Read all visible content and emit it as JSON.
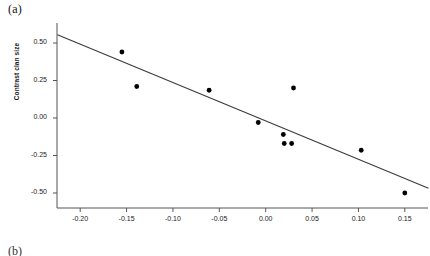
{
  "figure": {
    "panel_label": "(a)",
    "next_panel_label": "(b)"
  },
  "chart_data": {
    "type": "scatter",
    "title": "",
    "xlabel": "",
    "ylabel": "Contrast clan size",
    "xlim": [
      -0.225,
      0.175
    ],
    "ylim": [
      -0.6,
      0.62
    ],
    "grid": false,
    "legend": null,
    "xticks": [
      -0.2,
      -0.15,
      -0.1,
      -0.05,
      0.0,
      0.05,
      0.1,
      0.15
    ],
    "xticklabels": [
      "-0.20",
      "-0.15",
      "-0.10",
      "-0.05",
      "0.00",
      "0.05",
      "0.10",
      "0.15"
    ],
    "yticks": [
      0.5,
      0.25,
      0.0,
      -0.25,
      -0.5
    ],
    "yticklabels": [
      "0.50",
      "0.25",
      "0.00",
      "-0.25",
      "-0.50"
    ],
    "marker_color": "#000000",
    "marker_size": 3.6,
    "line_color": "#3a3a3a",
    "axis_color": "#555555",
    "points": [
      {
        "x": -0.155,
        "y": 0.44
      },
      {
        "x": -0.139,
        "y": 0.21
      },
      {
        "x": -0.061,
        "y": 0.185
      },
      {
        "x": -0.008,
        "y": -0.03
      },
      {
        "x": 0.019,
        "y": -0.11
      },
      {
        "x": 0.02,
        "y": -0.17
      },
      {
        "x": 0.028,
        "y": -0.17
      },
      {
        "x": 0.03,
        "y": 0.2
      },
      {
        "x": 0.103,
        "y": -0.215
      },
      {
        "x": 0.15,
        "y": -0.5
      }
    ],
    "series": [
      {
        "name": "regression-line",
        "type": "line",
        "x": [
          -0.2245,
          0.1755
        ],
        "y": [
          0.555,
          -0.468
        ]
      }
    ]
  }
}
